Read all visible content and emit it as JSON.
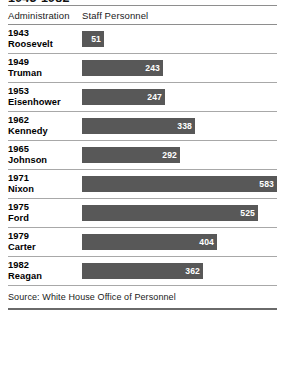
{
  "title": "1943-1982",
  "columns": {
    "administration": "Administration",
    "staff_personnel": "Staff Personnel"
  },
  "source": "Source: White House Office of Personnel",
  "style": {
    "bar_color": "#585858",
    "value_text_color": "#ffffff",
    "rule_color": "#8e8e8e",
    "background": "#ffffff"
  },
  "chart_data": {
    "type": "bar",
    "title": "1943-1982",
    "xlabel": "Staff Personnel",
    "ylabel": "Administration",
    "orientation": "horizontal",
    "grid": false,
    "legend": "none",
    "xlim": [
      0,
      583
    ],
    "categories": [
      "1943 Roosevelt",
      "1949 Truman",
      "1953 Eisenhower",
      "1962 Kennedy",
      "1965 Johnson",
      "1971 Nixon",
      "1975 Ford",
      "1979 Carter",
      "1982 Reagan"
    ],
    "values": [
      51,
      243,
      247,
      338,
      292,
      583,
      525,
      404,
      362
    ],
    "source": "Source: White House Office of Personnel"
  },
  "rows": [
    {
      "year": "1943",
      "name": "Roosevelt",
      "value": "51"
    },
    {
      "year": "1949",
      "name": "Truman",
      "value": "243"
    },
    {
      "year": "1953",
      "name": "Eisenhower",
      "value": "247"
    },
    {
      "year": "1962",
      "name": "Kennedy",
      "value": "338"
    },
    {
      "year": "1965",
      "name": "Johnson",
      "value": "292"
    },
    {
      "year": "1971",
      "name": "Nixon",
      "value": "583"
    },
    {
      "year": "1975",
      "name": "Ford",
      "value": "525"
    },
    {
      "year": "1979",
      "name": "Carter",
      "value": "404"
    },
    {
      "year": "1982",
      "name": "Reagan",
      "value": "362"
    }
  ]
}
